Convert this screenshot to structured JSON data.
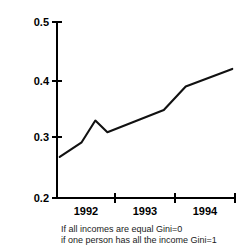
{
  "chart_data": {
    "type": "line",
    "title": "",
    "subtitle": "",
    "xlabel": "",
    "ylabel": "",
    "ylim": [
      0.2,
      0.5
    ],
    "xlim": [
      1991.6,
      1994.85
    ],
    "grid": false,
    "legend": null,
    "y_ticks": [
      "0.5",
      "0.4",
      "0.3",
      "0.2"
    ],
    "y_tick_values": [
      0.5,
      0.4,
      0.3,
      0.2
    ],
    "x_ticks": [
      "1992",
      "1993",
      "1994"
    ],
    "x_tick_values": [
      1992,
      1993,
      1994
    ],
    "series": [
      {
        "name": "Gini coefficient",
        "x": [
          1991.65,
          1992.05,
          1992.3,
          1992.52,
          1993.55,
          1993.95,
          1994.8
        ],
        "values": [
          0.27,
          0.295,
          0.332,
          0.312,
          0.35,
          0.39,
          0.42
        ]
      }
    ],
    "annotations": [
      "If all incomes are equal Gini=0",
      "if one person has all the income Gini=1"
    ]
  },
  "axis": {
    "y_labels": [
      {
        "text": "0.5",
        "value": 0.5
      },
      {
        "text": "0.4",
        "value": 0.4
      },
      {
        "text": "0.3",
        "value": 0.3
      },
      {
        "text": "0.2",
        "value": 0.2
      }
    ],
    "x_labels": [
      {
        "text": "1992",
        "value": 1992
      },
      {
        "text": "1993",
        "value": 1993
      },
      {
        "text": "1994",
        "value": 1994
      }
    ]
  },
  "caption": {
    "line1": "If all incomes are equal Gini=0",
    "line2": "if one person has all the income Gini=1"
  },
  "colors": {
    "line": "#111111",
    "axis": "#000000",
    "text": "#000000",
    "caption_text": "#1a1a1a",
    "background": "#ffffff"
  }
}
